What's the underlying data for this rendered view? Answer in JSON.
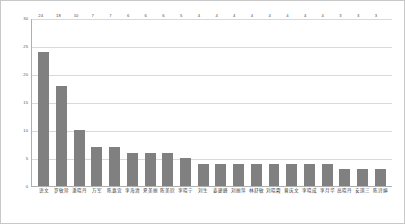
{
  "chart_data": {
    "type": "bar",
    "title": "",
    "subtitle": "",
    "xlabel": "",
    "ylabel": "",
    "ylim": [
      0,
      30
    ],
    "yticks": [
      0,
      5,
      10,
      15,
      20,
      25,
      30
    ],
    "grid": true,
    "legend": "none",
    "bar_color": "#808080",
    "show_value_labels": true,
    "categories": [
      "语文",
      "罗敏珍",
      "潘晓丹",
      "万军",
      "陈嘉宜",
      "李海清",
      "夏美丽",
      "陈美欣",
      "李晓宁",
      "刘生",
      "姜建峰",
      "刘丽萍",
      "林舒敏",
      "刘晓霞",
      "曾庆文",
      "李晓成",
      "李月华",
      "高晓丹",
      "安琪三",
      "陈诗婷"
    ],
    "values": [
      24,
      18,
      10,
      7,
      7,
      6,
      6,
      6,
      5,
      4,
      4,
      4,
      4,
      4,
      4,
      4,
      4,
      3,
      3,
      3
    ],
    "value_labels": [
      "24",
      "18",
      "10",
      "7",
      "7",
      "6",
      "6",
      "6",
      "5",
      "4",
      "4",
      "4",
      "4",
      "4",
      "4",
      "4",
      "4",
      "3",
      "3",
      "3"
    ],
    "ytick_labels": [
      "0",
      "5",
      "10",
      "15",
      "20",
      "25",
      "30"
    ]
  }
}
